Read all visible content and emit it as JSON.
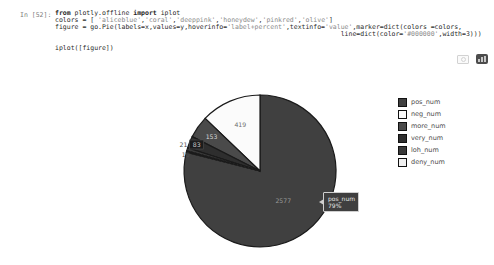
{
  "cell": {
    "prompt": "In [52]:",
    "code_lines": [
      "from plotly.offline import iplot",
      "colors = [ 'aliceblue','coral','deeppink','honeydew','pinkred','olive']",
      "figure = go.Pie(labels=x,values=y,hoverinfo='label+percent',textinfo='value',marker=dict(colors =colors,",
      "                                                                         line=dict(color='#000000',width=3)))",
      "",
      "iplot([figure])"
    ]
  },
  "modebar": {
    "camera_icon": "download-plot-as-png",
    "plotly_logo": "produced-with-plotly"
  },
  "chart_data": {
    "type": "pie",
    "title": "",
    "labels": [
      "pos_num",
      "neg_num",
      "more_num",
      "very_num",
      "loh_num",
      "deny_num"
    ],
    "values": [
      2577,
      419,
      153,
      83,
      21,
      10
    ],
    "textinfo": "value",
    "hoverinfo": "label+percent",
    "legend_position": "right",
    "outline": {
      "color": "#1a1a1a",
      "width": 1.2
    },
    "slices": [
      {
        "label": "pos_num",
        "value": 2577,
        "color": "#404040",
        "start_deg": 0,
        "end_deg": 284.3,
        "value_label": {
          "text": "2577",
          "r_frac": 0.5,
          "color": "#9a9a9a"
        }
      },
      {
        "label": "neg_num",
        "value": 419,
        "color": "#fbfbfb",
        "start_deg": 313.8,
        "end_deg": 360,
        "value_label": {
          "text": "419",
          "r_frac": 0.66,
          "color": "#6f6f6f"
        }
      },
      {
        "label": "more_num",
        "value": 153,
        "color": "#4a4a4a",
        "start_deg": 296.9,
        "end_deg": 313.8,
        "value_label": {
          "text": "153",
          "r_frac": 0.78,
          "color": "#d8d8d8"
        }
      },
      {
        "label": "very_num",
        "value": 83,
        "color": "#2e2e2e",
        "start_deg": 287.7,
        "end_deg": 296.9,
        "value_label": {
          "text": "83",
          "r_frac": 0.9,
          "color": "#d0d0d0",
          "bg": "#1c1c1c"
        }
      },
      {
        "label": "loh_num",
        "value": 21,
        "color": "#3a3a3a",
        "start_deg": 285.4,
        "end_deg": 287.7,
        "value_label": {
          "text": "21",
          "r_frac": 1.05,
          "color": "#4d4d4d",
          "dy": -3
        }
      },
      {
        "label": "deny_num",
        "value": 10,
        "color": "#f0f0f0",
        "start_deg": 284.3,
        "end_deg": 285.4,
        "value_label": {
          "text": "10",
          "r_frac": 1.01,
          "color": "#4d4d4d",
          "dy": 4
        }
      }
    ],
    "tooltip": {
      "label": "pos_num",
      "percent": "79%"
    }
  }
}
